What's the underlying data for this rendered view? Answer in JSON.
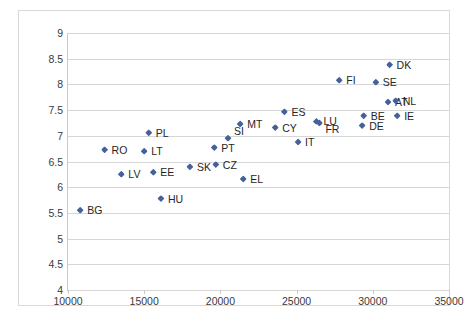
{
  "chart_data": {
    "type": "scatter",
    "title": "",
    "subtitle": "",
    "xlabel": "",
    "ylabel": "",
    "xlim": [
      10000,
      35000
    ],
    "ylim": [
      4,
      9
    ],
    "xticks": [
      10000,
      15000,
      20000,
      25000,
      30000,
      35000
    ],
    "yticks": [
      4,
      4.5,
      5,
      5.5,
      6,
      6.5,
      7,
      7.5,
      8,
      8.5,
      9
    ],
    "xtick_labels": [
      "10000",
      "15000",
      "20000",
      "25000",
      "30000",
      "35000"
    ],
    "ytick_labels": [
      "4",
      "4.5",
      "5",
      "5.5",
      "6",
      "6.5",
      "7",
      "7.5",
      "8",
      "8.5",
      "9"
    ],
    "grid": "horizontal",
    "legend": "none",
    "marker": "diamond",
    "marker_color": "#44619c",
    "points": [
      {
        "label": "BG",
        "x": 10800,
        "y": 5.55,
        "label_pos": "right"
      },
      {
        "label": "RO",
        "x": 12400,
        "y": 6.73,
        "label_pos": "right"
      },
      {
        "label": "LV",
        "x": 13500,
        "y": 6.25,
        "label_pos": "right"
      },
      {
        "label": "LT",
        "x": 15000,
        "y": 6.7,
        "label_pos": "right"
      },
      {
        "label": "PL",
        "x": 15300,
        "y": 7.06,
        "label_pos": "right"
      },
      {
        "label": "EE",
        "x": 15600,
        "y": 6.29,
        "label_pos": "right"
      },
      {
        "label": "HU",
        "x": 16100,
        "y": 5.78,
        "label_pos": "right"
      },
      {
        "label": "SK",
        "x": 18000,
        "y": 6.4,
        "label_pos": "right"
      },
      {
        "label": "CZ",
        "x": 19700,
        "y": 6.44,
        "label_pos": "right"
      },
      {
        "label": "PT",
        "x": 19600,
        "y": 6.77,
        "label_pos": "right"
      },
      {
        "label": "SI",
        "x": 20500,
        "y": 6.95,
        "label_pos": "upper-right"
      },
      {
        "label": "EL",
        "x": 21500,
        "y": 6.16,
        "label_pos": "right"
      },
      {
        "label": "MT",
        "x": 21300,
        "y": 7.23,
        "label_pos": "right"
      },
      {
        "label": "CY",
        "x": 23600,
        "y": 7.16,
        "label_pos": "right"
      },
      {
        "label": "ES",
        "x": 24200,
        "y": 7.47,
        "label_pos": "right"
      },
      {
        "label": "IT",
        "x": 25100,
        "y": 6.88,
        "label_pos": "right"
      },
      {
        "label": "LU",
        "x": 26300,
        "y": 7.28,
        "label_pos": "right"
      },
      {
        "label": "FR",
        "x": 26500,
        "y": 7.25,
        "label_pos": "lower-right"
      },
      {
        "label": "FI",
        "x": 27800,
        "y": 8.08,
        "label_pos": "right"
      },
      {
        "label": "DE",
        "x": 29300,
        "y": 7.2,
        "label_pos": "right"
      },
      {
        "label": "BE",
        "x": 29400,
        "y": 7.39,
        "label_pos": "right"
      },
      {
        "label": "SE",
        "x": 30200,
        "y": 8.04,
        "label_pos": "right"
      },
      {
        "label": "AT",
        "x": 31000,
        "y": 7.66,
        "label_pos": "right"
      },
      {
        "label": "DK",
        "x": 31100,
        "y": 8.38,
        "label_pos": "right"
      },
      {
        "label": "NL",
        "x": 31500,
        "y": 7.68,
        "label_pos": "right"
      },
      {
        "label": "IE",
        "x": 31600,
        "y": 7.39,
        "label_pos": "right"
      }
    ]
  },
  "colors": {
    "marker": "#44619c",
    "gridline": "#d6d6d6",
    "axis": "#c9c9c9",
    "frame": "#d9d9d9",
    "tick_text": "#3a3a3a",
    "label_text": "#262626",
    "background": "#ffffff"
  }
}
